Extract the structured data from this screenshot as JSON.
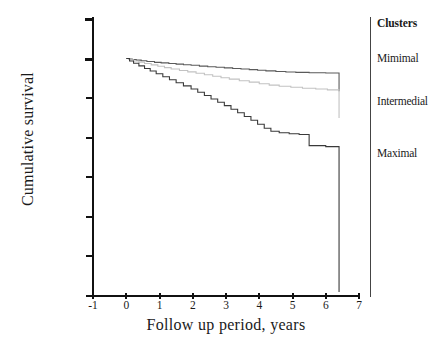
{
  "chart_data": {
    "type": "line",
    "title": "",
    "xlabel": "Follow up period, years",
    "ylabel": "Cumulative survival",
    "xlim": [
      -1,
      7
    ],
    "ylim": [
      0.988,
      1.002
    ],
    "xticks": [
      "-1",
      "0",
      "1",
      "2",
      "3",
      "4",
      "5",
      "6",
      "7"
    ],
    "yticks": [
      "1.002",
      "1.000",
      ".998",
      ".996",
      ".994",
      ".992",
      ".990",
      ".988"
    ],
    "ytick_values": [
      1.002,
      1.0,
      0.998,
      0.996,
      0.994,
      0.992,
      0.99,
      0.988
    ],
    "xtick_values": [
      -1,
      0,
      1,
      2,
      3,
      4,
      5,
      6,
      7
    ],
    "grid": false,
    "legend_position": "right",
    "legend_title": "Clusters",
    "series": [
      {
        "name": "Mimimal",
        "color": "#5a5a5a",
        "style": "step",
        "label_y": 1.0,
        "points": [
          [
            0.0,
            1.0
          ],
          [
            0.08,
            0.99998
          ],
          [
            0.18,
            0.99995
          ],
          [
            0.3,
            0.99992
          ],
          [
            0.45,
            0.99989
          ],
          [
            0.62,
            0.99985
          ],
          [
            0.85,
            0.99981
          ],
          [
            1.05,
            0.99978
          ],
          [
            1.28,
            0.99975
          ],
          [
            1.5,
            0.99972
          ],
          [
            1.72,
            0.99969
          ],
          [
            1.95,
            0.99966
          ],
          [
            2.2,
            0.99962
          ],
          [
            2.45,
            0.99959
          ],
          [
            2.7,
            0.99956
          ],
          [
            2.95,
            0.99953
          ],
          [
            3.2,
            0.9995
          ],
          [
            3.45,
            0.99947
          ],
          [
            3.7,
            0.99944
          ],
          [
            3.95,
            0.99941
          ],
          [
            4.2,
            0.99938
          ],
          [
            4.5,
            0.99935
          ],
          [
            4.8,
            0.99932
          ],
          [
            5.1,
            0.9993
          ],
          [
            5.5,
            0.99928
          ],
          [
            6.0,
            0.99927
          ],
          [
            6.4,
            0.99927
          ],
          [
            6.4,
            0.99835
          ]
        ]
      },
      {
        "name": "Intermedial",
        "color": "#c2c2c2",
        "style": "step",
        "label_y": 0.9978,
        "points": [
          [
            0.0,
            1.0
          ],
          [
            0.1,
            0.99994
          ],
          [
            0.22,
            0.99988
          ],
          [
            0.38,
            0.99982
          ],
          [
            0.55,
            0.99975
          ],
          [
            0.75,
            0.99968
          ],
          [
            0.95,
            0.99961
          ],
          [
            1.15,
            0.99954
          ],
          [
            1.35,
            0.99947
          ],
          [
            1.6,
            0.9994
          ],
          [
            1.85,
            0.99933
          ],
          [
            2.1,
            0.99926
          ],
          [
            2.35,
            0.99918
          ],
          [
            2.6,
            0.99911
          ],
          [
            2.85,
            0.99903
          ],
          [
            3.1,
            0.99896
          ],
          [
            3.4,
            0.99888
          ],
          [
            3.7,
            0.99881
          ],
          [
            4.0,
            0.99873
          ],
          [
            4.3,
            0.99866
          ],
          [
            4.6,
            0.9986
          ],
          [
            4.95,
            0.99855
          ],
          [
            5.3,
            0.9985
          ],
          [
            5.7,
            0.99846
          ],
          [
            6.05,
            0.99842
          ],
          [
            6.4,
            0.99842
          ],
          [
            6.4,
            0.997
          ]
        ]
      },
      {
        "name": "Maximal",
        "color": "#3a3a3a",
        "style": "step",
        "label_y": 0.9952,
        "points": [
          [
            0.0,
            1.0
          ],
          [
            0.1,
            0.99988
          ],
          [
            0.22,
            0.99976
          ],
          [
            0.38,
            0.99963
          ],
          [
            0.55,
            0.9995
          ],
          [
            0.72,
            0.99937
          ],
          [
            0.9,
            0.99923
          ],
          [
            1.1,
            0.99908
          ],
          [
            1.3,
            0.99893
          ],
          [
            1.5,
            0.99878
          ],
          [
            1.72,
            0.99862
          ],
          [
            1.95,
            0.99846
          ],
          [
            2.15,
            0.9983
          ],
          [
            2.35,
            0.99813
          ],
          [
            2.55,
            0.99796
          ],
          [
            2.75,
            0.99779
          ],
          [
            2.95,
            0.99762
          ],
          [
            3.15,
            0.99744
          ],
          [
            3.35,
            0.99726
          ],
          [
            3.55,
            0.99707
          ],
          [
            3.75,
            0.99688
          ],
          [
            3.95,
            0.99668
          ],
          [
            4.15,
            0.99648
          ],
          [
            4.35,
            0.99633
          ],
          [
            4.6,
            0.99625
          ],
          [
            4.9,
            0.9962
          ],
          [
            5.2,
            0.99616
          ],
          [
            5.5,
            0.9956
          ],
          [
            6.0,
            0.99555
          ],
          [
            6.4,
            0.99553
          ],
          [
            6.4,
            0.9882
          ]
        ]
      }
    ]
  },
  "axis": {
    "y_title": "Cumulative survival",
    "x_title": "Follow up period, years"
  },
  "legend": {
    "title": "Clusters",
    "items": [
      {
        "label": "Mimimal"
      },
      {
        "label": "Intermedial"
      },
      {
        "label": "Maximal"
      }
    ]
  }
}
